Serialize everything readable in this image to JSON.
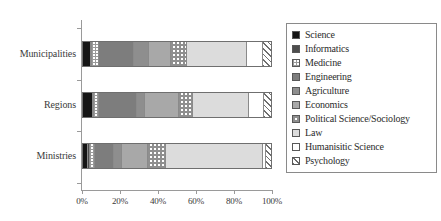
{
  "chart_data": {
    "type": "bar",
    "orientation": "horizontal",
    "stacked": true,
    "normalized_percent": true,
    "title": "",
    "xlabel": "",
    "ylabel": "",
    "xlim": [
      0,
      100
    ],
    "grid": false,
    "legend_position": "right",
    "categories": [
      "Municipalities",
      "Regions",
      "Ministries"
    ],
    "tick_labels": [
      "0%",
      "20%",
      "40%",
      "60%",
      "80%",
      "100%"
    ],
    "tick_values": [
      0,
      20,
      40,
      60,
      80,
      100
    ],
    "series": [
      {
        "name": "Science",
        "fill": "solid-black",
        "values": [
          4.0,
          5.5,
          2.5
        ]
      },
      {
        "name": "Informatics",
        "fill": "solid-dark-gray",
        "values": [
          0.5,
          0.5,
          1.0
        ]
      },
      {
        "name": "Medicine",
        "fill": "fine-dotted",
        "values": [
          4.0,
          2.5,
          3.0
        ]
      },
      {
        "name": "Engineering",
        "fill": "solid-gray",
        "values": [
          18.5,
          20.0,
          10.0
        ]
      },
      {
        "name": "Agriculture",
        "fill": "solid-mid-gray",
        "values": [
          8.0,
          4.5,
          4.5
        ]
      },
      {
        "name": "Economics",
        "fill": "solid-light-gray",
        "values": [
          12.0,
          18.0,
          13.5
        ]
      },
      {
        "name": "Political Science/Sociology",
        "fill": "checkered",
        "values": [
          8.5,
          7.5,
          9.5
        ]
      },
      {
        "name": "Law",
        "fill": "pale-gray",
        "values": [
          31.5,
          30.0,
          52.0
        ]
      },
      {
        "name": "Humanisitic Science",
        "fill": "white",
        "values": [
          9.0,
          8.0,
          1.5
        ]
      },
      {
        "name": "Psychology",
        "fill": "diagonal-hatch",
        "values": [
          4.0,
          3.5,
          2.5
        ]
      }
    ]
  },
  "legend": {
    "items": [
      {
        "label": "Science"
      },
      {
        "label": "Informatics"
      },
      {
        "label": "Medicine"
      },
      {
        "label": "Engineering"
      },
      {
        "label": "Agriculture"
      },
      {
        "label": "Economics"
      },
      {
        "label": "Political Science/Sociology"
      },
      {
        "label": "Law"
      },
      {
        "label": "Humanisitic Science"
      },
      {
        "label": "Psychology"
      }
    ]
  }
}
